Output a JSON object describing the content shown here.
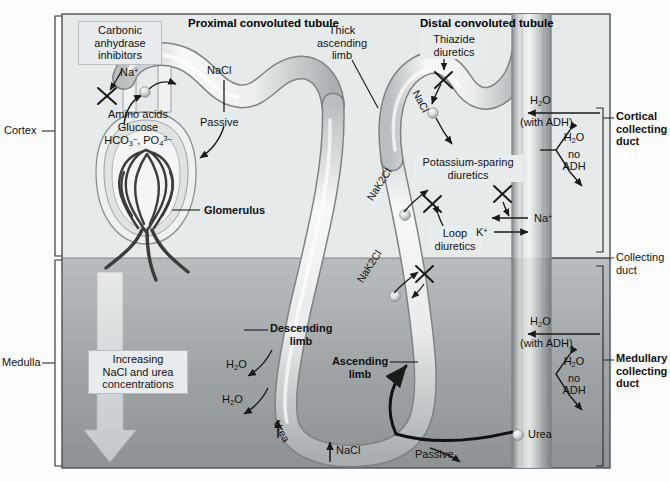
{
  "figure": {
    "type": "anatomical-diagram"
  },
  "regions": {
    "cortex_label": "Cortex",
    "medulla_label": "Medulla"
  },
  "headers": {
    "proximal": "Proximal convoluted tubule",
    "distal": "Distal convoluted tubule"
  },
  "drug_boxes": {
    "carbonic": "Carbonic\nanhydrase\ninhibitors",
    "carbonic_l1": "Carbonic",
    "carbonic_l2": "anhydrase",
    "carbonic_l3": "inhibitors",
    "thiazide_l1": "Thiazide",
    "thiazide_l2": "diuretics",
    "potassium_l1": "Potassium-sparing",
    "potassium_l2": "diuretics",
    "loop_l1": "Loop",
    "loop_l2": "diuretics",
    "gradient_l1": "Increasing",
    "gradient_l2": "NaCl and urea",
    "gradient_l3": "concentrations"
  },
  "structures": {
    "thick_ascending_l1": "Thick",
    "thick_ascending_l2": "ascending",
    "thick_ascending_l3": "limb",
    "glomerulus": "Glomerulus",
    "descending_l1": "Descending",
    "descending_l2": "limb",
    "ascending_l1": "Ascending",
    "ascending_l2": "limb",
    "cortical_cd_l1": "Cortical",
    "cortical_cd_l2": "collecting",
    "cortical_cd_l3": "duct",
    "collecting_duct_l1": "Collecting",
    "collecting_duct_l2": "duct",
    "medullary_cd_l1": "Medullary",
    "medullary_cd_l2": "collecting",
    "medullary_cd_l3": "duct"
  },
  "transport": {
    "na_pct": "Na",
    "na_sup": "+",
    "nacl_pct": "NaCl",
    "passive_pct": "Passive",
    "amino": "Amino acids",
    "glucose": "Glucose",
    "hco3_base": "HCO",
    "hco3_sub": "3",
    "hco3_sup": "–",
    "po4_base": ", PO",
    "po4_sub": "4",
    "po4_sup": "3–",
    "nacl_distal": "NaCl",
    "nak2cl_upper": "NaK2Cl",
    "nak2cl_lower": "NaK2Cl",
    "h2o_base": "H",
    "h2o_sub": "2",
    "h2o_tail": "O",
    "with_adh": "(with ADH)",
    "no": "no",
    "adh": "ADH",
    "na_plus": "Na",
    "k_plus": "K",
    "plus": "+",
    "urea": "Urea",
    "urea_loop": "Urea",
    "nacl_loop": "NaCl",
    "passive_loop": "Passive"
  },
  "colors": {
    "cortex_bg": "#e7eaeb",
    "medulla_bg": "#9ba1a3",
    "tubule_light": "#f4f5f6",
    "tubule_edge": "#7d8385",
    "frame": "#4b5053",
    "box_fill": "#e9ecef",
    "glomerulus": "#4a4a4a",
    "arrow": "#1a1a1a"
  }
}
